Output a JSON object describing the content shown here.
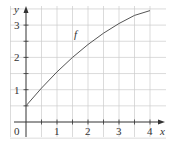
{
  "chart_data": {
    "type": "line",
    "title": "",
    "xlabel": "x",
    "ylabel": "y",
    "xlim": [
      0,
      4.3
    ],
    "ylim": [
      0,
      3.5
    ],
    "grid": true,
    "grid_step": 0.5,
    "x_ticks": [
      "1",
      "2",
      "3",
      "4"
    ],
    "y_ticks": [
      "1",
      "2",
      "3"
    ],
    "origin_label": "0",
    "series": [
      {
        "name": "f",
        "x": [
          0,
          0.5,
          1,
          1.5,
          2,
          2.5,
          3,
          3.5,
          4
        ],
        "y": [
          0.5,
          1.05,
          1.55,
          2.0,
          2.4,
          2.75,
          3.05,
          3.3,
          3.45
        ]
      }
    ],
    "annotations": [
      {
        "text": "f",
        "x": 1.55,
        "y": 2.6
      }
    ],
    "colors": {
      "grid": "#cccccc",
      "axis": "#333333",
      "curve": "#555555"
    }
  }
}
